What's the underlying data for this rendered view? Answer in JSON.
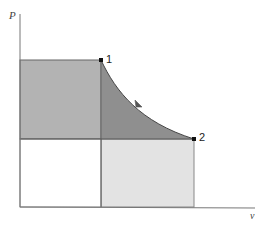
{
  "diagram": {
    "type": "P-v diagram",
    "axes": {
      "y_label": "P",
      "x_label": "v"
    },
    "points": [
      {
        "id": "1",
        "label": "1"
      },
      {
        "id": "2",
        "label": "2"
      }
    ],
    "process": {
      "from": "1",
      "to": "2",
      "curve": "expansion curve with direction arrow"
    },
    "regions": [
      {
        "name": "rectangle-left-upper",
        "fill": "#b3b3b3"
      },
      {
        "name": "area-under-curve-above-p2",
        "fill": "#8f8f8f"
      },
      {
        "name": "rectangle-right-lower",
        "fill": "#e3e3e3"
      },
      {
        "name": "rectangle-left-lower",
        "fill": "#ffffff"
      }
    ],
    "colors": {
      "axis": "#777777",
      "outline": "#666666",
      "point": "#111111"
    }
  }
}
